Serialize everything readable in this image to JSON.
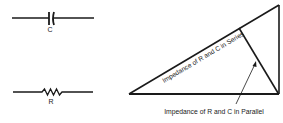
{
  "symbols": {
    "capacitor": {
      "label": "C"
    },
    "resistor": {
      "label": "R"
    }
  },
  "triangle": {
    "hypotenuse_label": "Impedance of R and C in Series",
    "perpendicular_label": "Impedance of R and C in Parallel"
  },
  "colors": {
    "line": "#1a1a1a",
    "background": "#ffffff"
  }
}
